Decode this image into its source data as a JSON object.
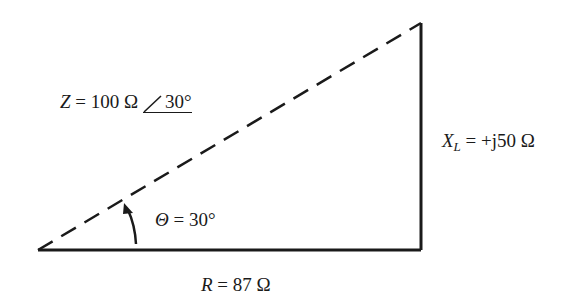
{
  "diagram": {
    "type": "impedance-triangle",
    "colors": {
      "line": "#1a1a1a",
      "background": "#ffffff"
    },
    "vertices": {
      "origin": [
        38,
        250
      ],
      "right_bottom": [
        421,
        250
      ],
      "top": [
        421,
        23
      ]
    },
    "labels": {
      "impedance": {
        "symbol": "Z",
        "eq": " = 100 Ω ",
        "angle": "30°"
      },
      "reactance": {
        "symbol": "X",
        "subscript": "L",
        "eq": " = +j50 Ω"
      },
      "resistance": {
        "symbol": "R",
        "eq": " = 87 Ω"
      },
      "theta": {
        "symbol": "Θ",
        "eq": " = 30°"
      }
    }
  }
}
